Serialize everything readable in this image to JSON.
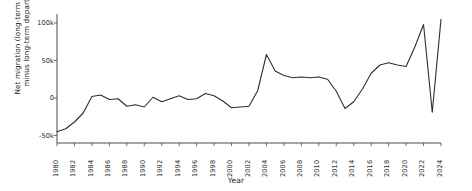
{
  "chart_data": {
    "type": "line",
    "title": "",
    "xlabel": "Year",
    "ylabel": "Net migration (long-term arrivals\nminus long-term departures)",
    "xlim": [
      1980,
      2024
    ],
    "ylim": [
      -60000,
      112000
    ],
    "grid": false,
    "legend": null,
    "y_tick_values": [
      -50000,
      0,
      50000,
      100000
    ],
    "y_tick_labels": [
      "-50k",
      "0",
      "50k",
      "100k"
    ],
    "x_tick_values": [
      1980,
      1982,
      1984,
      1986,
      1988,
      1990,
      1992,
      1994,
      1996,
      1998,
      2000,
      2002,
      2004,
      2006,
      2008,
      2010,
      2012,
      2014,
      2016,
      2018,
      2020,
      2022,
      2024
    ],
    "x_tick_labels": [
      "1980",
      "1982",
      "1984",
      "1986",
      "1988",
      "1990",
      "1992",
      "1994",
      "1996",
      "1998",
      "2000",
      "2002",
      "2004",
      "2006",
      "2008",
      "2010",
      "2012",
      "2014",
      "2016",
      "2018",
      "2020",
      "2022",
      "2024"
    ],
    "series": [
      {
        "name": "Net migration",
        "color": "#2e2e2e",
        "x": [
          1980,
          1981,
          1982,
          1983,
          1984,
          1985,
          1986,
          1987,
          1988,
          1989,
          1990,
          1991,
          1992,
          1993,
          1994,
          1995,
          1996,
          1997,
          1998,
          1999,
          2000,
          2001,
          2002,
          2003,
          2004,
          2005,
          2006,
          2007,
          2008,
          2009,
          2010,
          2011,
          2012,
          2013,
          2014,
          2015,
          2016,
          2017,
          2018,
          2019,
          2020,
          2021,
          2022,
          2023,
          2024
        ],
        "y": [
          -45000,
          -41000,
          -32000,
          -20000,
          2000,
          4000,
          -2000,
          -1000,
          -11000,
          -9000,
          -12000,
          1000,
          -5000,
          -1000,
          3000,
          -2000,
          -1000,
          6000,
          3000,
          -4000,
          -13000,
          -12000,
          -11000,
          10000,
          58000,
          36000,
          30000,
          27000,
          28000,
          27000,
          28000,
          25000,
          9000,
          -14000,
          -5000,
          12000,
          33000,
          44000,
          47000,
          44000,
          42000,
          68000,
          98000,
          -19000,
          105000
        ]
      }
    ]
  },
  "axes": {
    "y_axis_title": "Net migration (long-term arrivals\nminus long-term departures)",
    "x_axis_title": "Year"
  }
}
